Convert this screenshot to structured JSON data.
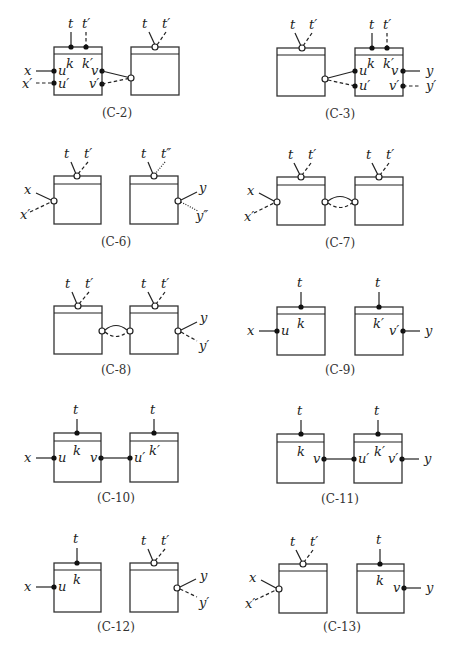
{
  "figure": {
    "panels": [
      {
        "id": "C-2",
        "caption": "(C-2)",
        "labels": {
          "t": "t",
          "tp": "t′",
          "k": "k",
          "kp": "k′",
          "x": "x",
          "xp": "x′",
          "u": "u",
          "up": "u′",
          "v": "v",
          "vp": "v′",
          "t2": "t",
          "tp2": "t′"
        }
      },
      {
        "id": "C-3",
        "caption": "(C-3)",
        "labels": {
          "t": "t",
          "tp": "t′",
          "t2": "t",
          "tp2": "t′",
          "k": "k",
          "kp": "k′",
          "u": "u",
          "up": "u′",
          "v": "v",
          "vp": "v′",
          "y": "y",
          "yp": "y′"
        }
      },
      {
        "id": "C-6",
        "caption": "(C-6)",
        "labels": {
          "t": "t",
          "tp": "t′",
          "x": "x",
          "xp": "x′",
          "t2": "t",
          "tpp": "t″",
          "y": "y",
          "ypp": "y″"
        }
      },
      {
        "id": "C-7",
        "caption": "(C-7)",
        "labels": {
          "t": "t",
          "tp": "t′",
          "x": "x",
          "xp": "x′",
          "t2": "t",
          "tp2": "t′"
        }
      },
      {
        "id": "C-8",
        "caption": "(C-8)",
        "labels": {
          "t": "t",
          "tp": "t′",
          "t2": "t",
          "tp2": "t′",
          "y": "y",
          "yp": "y′"
        }
      },
      {
        "id": "C-9",
        "caption": "(C-9)",
        "labels": {
          "t": "t",
          "k": "k",
          "x": "x",
          "u": "u",
          "t2": "t",
          "kp": "k′",
          "vp": "v′",
          "y": "y"
        }
      },
      {
        "id": "C-10",
        "caption": "(C-10)",
        "labels": {
          "t": "t",
          "k": "k",
          "x": "x",
          "u": "u",
          "v": "v",
          "t2": "t",
          "kp": "k′",
          "up": "u′"
        }
      },
      {
        "id": "C-11",
        "caption": "(C-11)",
        "labels": {
          "t": "t",
          "k": "k",
          "v": "v",
          "t2": "t",
          "kp": "k′",
          "up": "u′",
          "vp": "v′",
          "y": "y"
        }
      },
      {
        "id": "C-12",
        "caption": "(C-12)",
        "labels": {
          "t": "t",
          "k": "k",
          "x": "x",
          "u": "u",
          "t2": "t",
          "tp2": "t′",
          "y": "y",
          "yp": "y′"
        }
      },
      {
        "id": "C-13",
        "caption": "(C-13)",
        "labels": {
          "t": "t",
          "tp": "t′",
          "x": "x",
          "xp": "x′",
          "t2": "t",
          "k": "k",
          "v": "v",
          "y": "y"
        }
      }
    ]
  }
}
